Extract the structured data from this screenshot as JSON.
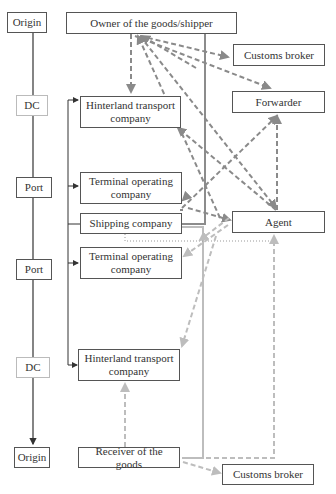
{
  "colors": {
    "solid_dark": "#444444",
    "dashed_dark": "#8a8a8a",
    "dashed_light": "#bdbdbd",
    "thick_line": "#8c8c8c",
    "dotted": "#999999"
  },
  "left_column": [
    {
      "id": "origin-top",
      "label": "Origin"
    },
    {
      "id": "dc-top",
      "label": "DC"
    },
    {
      "id": "port-top",
      "label": "Port"
    },
    {
      "id": "port-bottom",
      "label": "Port"
    },
    {
      "id": "dc-bottom",
      "label": "DC"
    },
    {
      "id": "origin-bottom",
      "label": "Origin"
    }
  ],
  "center_column": [
    {
      "id": "owner",
      "label": "Owner of the goods/shipper"
    },
    {
      "id": "hinterland-top",
      "label": "Hinterland transport company"
    },
    {
      "id": "terminal-top",
      "label": "Terminal operating company"
    },
    {
      "id": "shipping",
      "label": "Shipping company"
    },
    {
      "id": "terminal-bottom",
      "label": "Terminal operating company"
    },
    {
      "id": "hinterland-bottom",
      "label": "Hinterland transport company"
    },
    {
      "id": "receiver",
      "label": "Receiver of the goods"
    }
  ],
  "right_column": [
    {
      "id": "customs-top",
      "label": "Customs broker"
    },
    {
      "id": "forwarder",
      "label": "Forwarder"
    },
    {
      "id": "agent",
      "label": "Agent"
    },
    {
      "id": "customs-bottom",
      "label": "Customs broker"
    }
  ]
}
